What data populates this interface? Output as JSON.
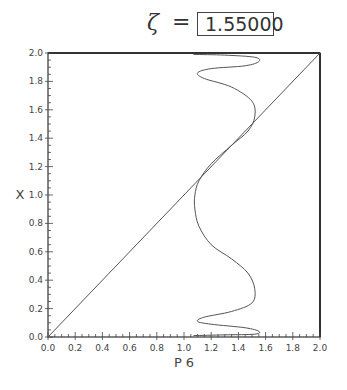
{
  "header": {
    "symbol": "ζ",
    "equals": "=",
    "value": "1.55000"
  },
  "chart_data": {
    "type": "line",
    "title": "ζ = 1.55000",
    "xlabel": "P 6",
    "ylabel": "X",
    "xlim": [
      0.0,
      2.0
    ],
    "ylim": [
      0.0,
      2.0
    ],
    "xticks": [
      "0.0",
      "0.2",
      "0.4",
      "0.6",
      "0.8",
      "1.0",
      "1.2",
      "1.4",
      "1.6",
      "1.8",
      "2.0"
    ],
    "yticks": [
      "0.0",
      "0.2",
      "0.4",
      "0.6",
      "0.8",
      "1.0",
      "1.2",
      "1.4",
      "1.6",
      "1.8",
      "2.0"
    ],
    "grid": false,
    "series": [
      {
        "name": "identity",
        "x": [
          0.0,
          2.0
        ],
        "y": [
          0.0,
          2.0
        ]
      },
      {
        "name": "P6 map",
        "x": [
          1.07,
          1.3,
          1.52,
          1.55,
          1.45,
          1.2,
          1.1,
          1.15,
          1.35,
          1.5,
          1.52,
          1.47,
          1.35,
          1.2,
          1.11,
          1.08,
          1.08,
          1.11,
          1.2,
          1.35,
          1.47,
          1.52,
          1.5,
          1.35,
          1.15,
          1.1,
          1.2,
          1.45,
          1.55,
          1.52,
          1.3,
          1.07
        ],
        "y": [
          1.99,
          1.985,
          1.97,
          1.94,
          1.91,
          1.89,
          1.86,
          1.82,
          1.76,
          1.66,
          1.55,
          1.45,
          1.35,
          1.22,
          1.1,
          1.0,
          0.9,
          0.78,
          0.65,
          0.55,
          0.45,
          0.34,
          0.24,
          0.18,
          0.14,
          0.11,
          0.09,
          0.065,
          0.04,
          0.02,
          0.015,
          0.01
        ]
      }
    ],
    "legend": null
  }
}
